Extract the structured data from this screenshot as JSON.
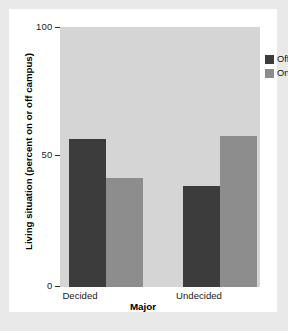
{
  "figure": {
    "background_color": "#e9e9e9",
    "card_color": "#ffffff",
    "plot_background_color": "#d5d5d5"
  },
  "legend": {
    "position": "top-right",
    "entries": [
      {
        "label": "Off",
        "color": "#3c3c3c"
      },
      {
        "label": "On",
        "color": "#8d8d8d"
      }
    ]
  },
  "chart_data": {
    "type": "bar",
    "title": "",
    "xlabel": "Major",
    "ylabel": "Living situation (percent on or off campus)",
    "categories": [
      "Decided",
      "Undecided"
    ],
    "series": [
      {
        "name": "Off",
        "color": "#3c3c3c",
        "values": [
          57,
          39
        ]
      },
      {
        "name": "On",
        "color": "#8d8d8d",
        "values": [
          42,
          58
        ]
      }
    ],
    "ylim": [
      0,
      100
    ],
    "yticks": [
      0,
      50,
      100
    ],
    "ytick_labels": [
      "0",
      "50",
      "100"
    ],
    "xtick_labels": [
      "Decided",
      "Undecided"
    ],
    "grid": false,
    "legend_position": "top-right"
  }
}
